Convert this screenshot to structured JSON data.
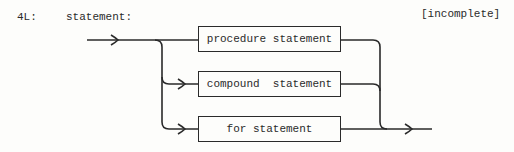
{
  "figure": {
    "label": "4L:",
    "rule_name": "statement:",
    "note": "[incomplete]"
  },
  "diagram": {
    "type": "syntax-diagram",
    "alternatives": [
      {
        "label": "procedure statement"
      },
      {
        "label": "compound  statement"
      },
      {
        "label": "for statement"
      }
    ]
  }
}
